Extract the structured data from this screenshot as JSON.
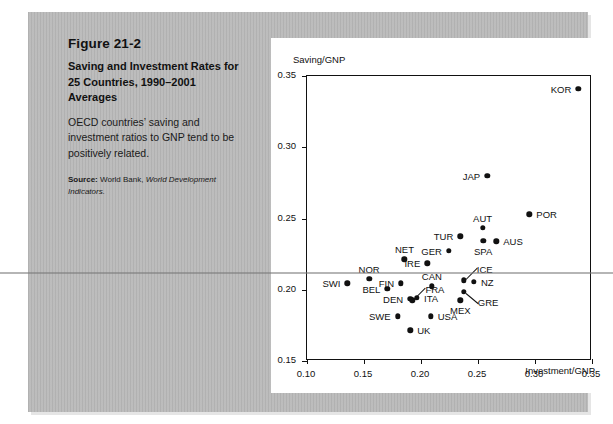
{
  "figure": {
    "number": "Figure 21-2",
    "title": "Saving and Investment Rates for 25 Countries, 1990–2001 Averages",
    "description": "OECD countries’ saving and investment ratios to GNP tend to be positively related.",
    "source_label": "Source:",
    "source_text": "World Bank,",
    "source_italic": "World Development Indicators."
  },
  "chart_data": {
    "type": "scatter",
    "title": "",
    "xlabel": "Investment/GNP",
    "ylabel": "Saving/GNP",
    "xlim": [
      0.1,
      0.35
    ],
    "ylim": [
      0.15,
      0.35
    ],
    "xticks": [
      "0.10",
      "0.15",
      "0.20",
      "0.25",
      "0.30",
      "0.35"
    ],
    "yticks": [
      "0.15",
      "0.20",
      "0.25",
      "0.30",
      "0.35"
    ],
    "xtick_values": [
      0.1,
      0.15,
      0.2,
      0.25,
      0.3,
      0.35
    ],
    "ytick_values": [
      0.15,
      0.2,
      0.25,
      0.3,
      0.35
    ],
    "grid": false,
    "legend": "none",
    "points": [
      {
        "label": "KOR",
        "x": 0.338,
        "y": 0.341,
        "label_pos": "left"
      },
      {
        "label": "JAP",
        "x": 0.258,
        "y": 0.28,
        "label_pos": "left"
      },
      {
        "label": "POR",
        "x": 0.295,
        "y": 0.253,
        "label_pos": "right"
      },
      {
        "label": "AUT",
        "x": 0.254,
        "y": 0.2435,
        "label_pos": "above"
      },
      {
        "label": "SPA",
        "x": 0.2545,
        "y": 0.2345,
        "label_pos": "below"
      },
      {
        "label": "AUS",
        "x": 0.266,
        "y": 0.234,
        "label_pos": "right"
      },
      {
        "label": "TUR",
        "x": 0.2345,
        "y": 0.2375,
        "label_pos": "left"
      },
      {
        "label": "GER",
        "x": 0.2245,
        "y": 0.2275,
        "label_pos": "left"
      },
      {
        "label": "NET",
        "x": 0.1855,
        "y": 0.2215,
        "label_pos": "above"
      },
      {
        "label": "IRE",
        "x": 0.2055,
        "y": 0.2185,
        "label_pos": "left"
      },
      {
        "label": "ICE",
        "x": 0.2375,
        "y": 0.2065,
        "label_pos": "leader-up-right"
      },
      {
        "label": "NZ",
        "x": 0.2465,
        "y": 0.2055,
        "label_pos": "right"
      },
      {
        "label": "CAN",
        "x": 0.2095,
        "y": 0.2025,
        "label_pos": "above"
      },
      {
        "label": "NOR",
        "x": 0.1545,
        "y": 0.2075,
        "label_pos": "above"
      },
      {
        "label": "SWI",
        "x": 0.1355,
        "y": 0.2045,
        "label_pos": "left"
      },
      {
        "label": "FIN",
        "x": 0.1825,
        "y": 0.2045,
        "label_pos": "left"
      },
      {
        "label": "BEL",
        "x": 0.1705,
        "y": 0.2005,
        "label_pos": "left"
      },
      {
        "label": "GRE",
        "x": 0.2375,
        "y": 0.1985,
        "label_pos": "leader-down-right"
      },
      {
        "label": "MEX",
        "x": 0.2345,
        "y": 0.1925,
        "label_pos": "below"
      },
      {
        "label": "DEN",
        "x": 0.1905,
        "y": 0.1935,
        "label_pos": "left"
      },
      {
        "label": "ITA",
        "x": 0.1965,
        "y": 0.1945,
        "label_pos": "right"
      },
      {
        "label": "FRA",
        "x": 0.1925,
        "y": 0.1925,
        "label_pos": "leader-up-right"
      },
      {
        "label": "USA",
        "x": 0.2085,
        "y": 0.1815,
        "label_pos": "right"
      },
      {
        "label": "SWE",
        "x": 0.1795,
        "y": 0.1815,
        "label_pos": "left"
      },
      {
        "label": "UK",
        "x": 0.1905,
        "y": 0.1715,
        "label_pos": "right"
      }
    ]
  }
}
